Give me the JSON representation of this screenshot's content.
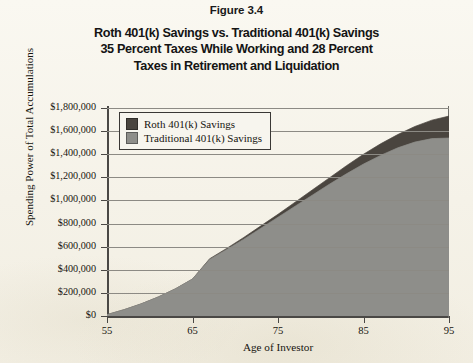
{
  "figure": {
    "label": "Figure 3.4",
    "title_lines": [
      "Roth 401(k) Savings vs. Traditional 401(k) Savings",
      "35 Percent Taxes While Working and 28 Percent",
      "Taxes in Retirement and Liquidation"
    ]
  },
  "legend": {
    "position": "top-left-inside",
    "items": [
      {
        "label": "Roth 401(k) Savings",
        "color": "#4a453f"
      },
      {
        "label": "Traditional 401(k) Savings",
        "color": "#8e8e8a"
      }
    ]
  },
  "axes": {
    "y_title": "Spending Power of Total Accumulations",
    "x_title": "Age of Investor",
    "y_ticks": [
      "$0",
      "$200,000",
      "$400,000",
      "$600,000",
      "$800,000",
      "$1,000,000",
      "$1,200,000",
      "$1,400,000",
      "$1,600,000",
      "$1,800,000"
    ],
    "x_ticks": [
      "55",
      "65",
      "75",
      "85",
      "95"
    ]
  },
  "chart_data": {
    "type": "area",
    "title": "Roth 401(k) Savings vs. Traditional 401(k) Savings 35 Percent Taxes While Working and 28 Percent Taxes in Retirement and Liquidation",
    "xlabel": "Age of Investor",
    "ylabel": "Spending Power of Total Accumulations",
    "xlim": [
      55,
      95
    ],
    "ylim": [
      0,
      1800000
    ],
    "ytick_step": 200000,
    "xtick_step": 10,
    "grid": "horizontal",
    "stacked": false,
    "x": [
      55,
      57,
      59,
      61,
      63,
      65,
      67,
      69,
      71,
      73,
      75,
      77,
      79,
      81,
      83,
      85,
      87,
      89,
      91,
      93,
      95
    ],
    "series": [
      {
        "name": "Roth 401(k) Savings",
        "color": "#4a453f",
        "values": [
          12000,
          55000,
          105000,
          165000,
          235000,
          320000,
          495000,
          585000,
          680000,
          780000,
          880000,
          985000,
          1090000,
          1195000,
          1300000,
          1400000,
          1490000,
          1570000,
          1640000,
          1695000,
          1730000
        ]
      },
      {
        "name": "Traditional 401(k) Savings",
        "color": "#8e8e8a",
        "values": [
          12000,
          55000,
          105000,
          165000,
          235000,
          320000,
          490000,
          575000,
          665000,
          760000,
          855000,
          950000,
          1045000,
          1140000,
          1230000,
          1315000,
          1390000,
          1455000,
          1505000,
          1535000,
          1540000
        ]
      }
    ]
  }
}
